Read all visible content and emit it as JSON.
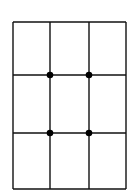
{
  "diagram": {
    "type": "grid",
    "rows": 3,
    "columns": 3,
    "line_color": "#111111",
    "dot_color": "#000000",
    "background": "#ffffff",
    "x_lines": [
      13,
      50,
      89,
      126
    ],
    "y_lines": [
      22,
      75,
      133,
      189
    ],
    "dots": [
      {
        "x": 50,
        "y": 75
      },
      {
        "x": 89,
        "y": 75
      },
      {
        "x": 50,
        "y": 133
      },
      {
        "x": 89,
        "y": 133
      }
    ]
  }
}
